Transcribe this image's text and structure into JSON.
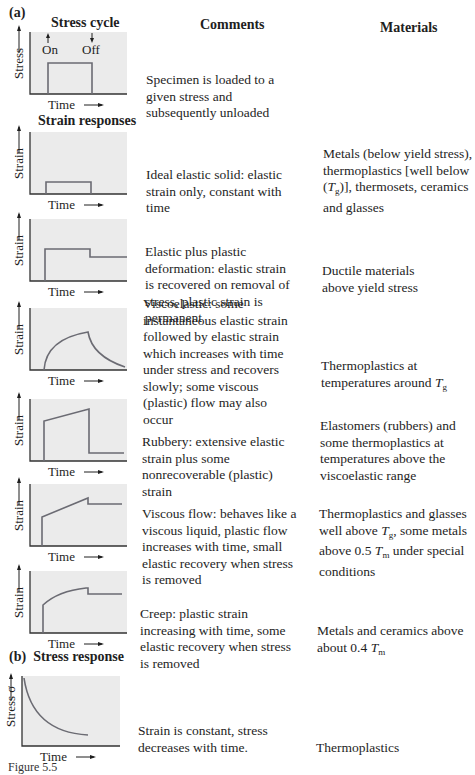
{
  "figure": {
    "part_a_label": "(a)",
    "part_b_label": "(b)",
    "part_b_title": "Stress response",
    "headers": {
      "stress_cycle": "Stress cycle",
      "comments": "Comments",
      "materials": "Materials",
      "strain_responses": "Strain responses"
    },
    "axis": {
      "time": "Time",
      "stress": "Stress",
      "strain": "Strain",
      "stress_sigma": "Stress σ",
      "on": "On",
      "off": "Off"
    },
    "rows": [
      {
        "id": "stress-cycle",
        "y_label": "Stress",
        "curve": "square-pulse",
        "comment": "Specimen is loaded to a given stress and subsequently unloaded",
        "material": ""
      },
      {
        "id": "ideal-elastic",
        "y_label": "Strain",
        "curve": "small-square-pulse",
        "comment": "Ideal elastic solid: elastic strain only, constant with time",
        "material_parts": [
          "Metals (below yield stress), thermoplastics [well below (",
          "T",
          "g",
          ")], thermosets, ceramics and glasses"
        ]
      },
      {
        "id": "elastic-plastic",
        "y_label": "Strain",
        "curve": "step-with-permanent-set",
        "comment": "Elastic plus plastic deformation: elastic strain is recovered on removal of stress, plastic strain is permanent",
        "material": "Ductile materials above yield stress"
      },
      {
        "id": "viscoelastic",
        "y_label": "Strain",
        "curve": "rise-and-slow-recovery",
        "comment": "Viscoelastic: some instantaneous elastic strain followed by elastic strain which increases with time under stress and recovers slowly; some viscous (plastic) flow may also occur",
        "material_parts": [
          "Thermoplastics at temperatures around ",
          "T",
          "g",
          ""
        ]
      },
      {
        "id": "rubbery",
        "y_label": "Strain",
        "curve": "jump-ramp-drop",
        "comment": "Rubbery: extensive elastic strain plus some nonrecoverable (plastic) strain",
        "material": "Elastomers (rubbers) and some thermoplastics at temperatures above the viscoelastic range"
      },
      {
        "id": "viscous-flow",
        "y_label": "Strain",
        "curve": "linear-ramp-small-recovery",
        "comment": "Viscous flow: behaves like a viscous liquid, plastic flow increases with time, small elastic recovery when stress is removed",
        "material_html": "Thermoplastics and glasses well above <i>T</i><sub class=\"sub\">g</sub>, some metals above 0.5 <i>T</i><sub class=\"sub\">m</sub> under special conditions"
      },
      {
        "id": "creep",
        "y_label": "Strain",
        "curve": "decelerating-ramp-small-recovery",
        "comment": "Creep: plastic strain increasing with time, some elastic recovery when stress is removed",
        "material_parts": [
          "Metals and ceramics above about 0.4 ",
          "T",
          "m",
          ""
        ]
      },
      {
        "id": "stress-relaxation",
        "y_label": "Stress σ",
        "curve": "decaying-stress",
        "comment": "Strain is constant, stress decreases with time.",
        "material": "Thermoplastics"
      }
    ],
    "colors": {
      "panel_fill": "#ebebeb",
      "curve": "#6b6b73",
      "axis": "#333333",
      "text": "#1e1e1e"
    },
    "caption_visible": "Figure 5.5"
  }
}
